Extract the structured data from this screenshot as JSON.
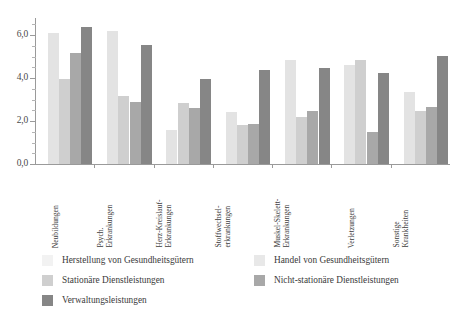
{
  "chart_data": {
    "type": "bar",
    "title": "",
    "subtitle": "",
    "xlabel": "",
    "ylabel": "",
    "ylim": [
      0,
      6.8
    ],
    "yticks": [
      "0,0",
      "2,0",
      "4,0",
      "6,0"
    ],
    "ytick_values": [
      0,
      2,
      4,
      6
    ],
    "grid": false,
    "legend_position": "bottom",
    "categories": [
      "Neubildungen",
      "Psych. Erkrankungen",
      "Herz-Kreislauf-Erkrankungen",
      "Stoffwechsel-erkrankungen",
      "Muskel-Skelett-Erkrankungen",
      "Verletzungen",
      "Sonstige Krankheiten"
    ],
    "category_lines": [
      [
        "Neubildungen"
      ],
      [
        "Psych.",
        "Erkrankungen"
      ],
      [
        "Herz-Kreislauf-",
        "Erkrankungen"
      ],
      [
        "Stoffwechsel-",
        "erkrankungen"
      ],
      [
        "Muskel-Skelett-",
        "Erkrankungen"
      ],
      [
        "Verletzungen"
      ],
      [
        "Sonstige",
        "Krankheiten"
      ]
    ],
    "series": [
      {
        "name": "Herstellung von Gesundheitsgütern",
        "color": "#f2f2f2",
        "values": [
          0.0,
          0.0,
          0.0,
          0.0,
          0.0,
          0.0,
          0.0
        ]
      },
      {
        "name": "Handel von Gesundheitsgütern",
        "color": "#e3e3e3",
        "values": [
          6.1,
          6.2,
          1.6,
          2.4,
          4.85,
          4.6,
          3.35
        ]
      },
      {
        "name": "Stationäre Dienstleistungen",
        "color": "#cfcfcf",
        "values": [
          3.95,
          3.15,
          2.85,
          1.8,
          2.2,
          4.85,
          2.45
        ]
      },
      {
        "name": "Nicht-stationäre Dienstleistungen",
        "color": "#a8a8a8",
        "values": [
          5.15,
          2.9,
          2.6,
          1.85,
          2.45,
          1.5,
          2.65
        ]
      },
      {
        "name": "Verwaltungsleistungen",
        "color": "#868686",
        "values": [
          6.4,
          5.55,
          3.95,
          4.4,
          4.45,
          4.25,
          5.05
        ]
      }
    ]
  },
  "legend": {
    "items": [
      {
        "label": "Herstellung von Gesundheitsgütern",
        "color": "#f2f2f2"
      },
      {
        "label": "Handel von Gesundheitsgütern",
        "color": "#e8e8e8"
      },
      {
        "label": "Stationäre Dienstleistungen",
        "color": "#cfcfcf"
      },
      {
        "label": "Nicht-stationäre Dienstleistungen",
        "color": "#a8a8a8"
      },
      {
        "label": "Verwaltungsleistungen",
        "color": "#868686"
      }
    ]
  }
}
